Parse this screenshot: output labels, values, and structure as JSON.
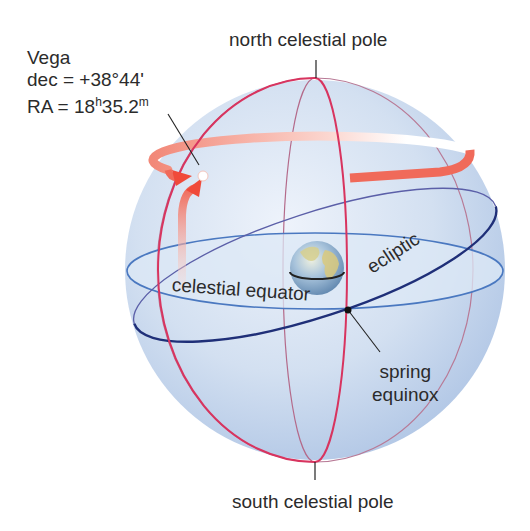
{
  "diagram": {
    "star": {
      "name": "Vega",
      "dec_label": "dec = +38°44'",
      "ra_prefix": "RA = 18",
      "ra_h": "h",
      "ra_mid": "35.2",
      "ra_m": "m"
    },
    "labels": {
      "north_pole": "north celestial pole",
      "south_pole": "south celestial pole",
      "celestial_equator": "celestial equator",
      "ecliptic": "ecliptic",
      "spring_line1": "spring",
      "spring_line2": "equinox"
    },
    "colors": {
      "sphere_fill": "#c9d9ee",
      "sphere_edge": "#a9c1e2",
      "meridian": "#d8345f",
      "meridian_thin": "#b46a8a",
      "equator": "#4a78c0",
      "equator_fill": "#dce8f6",
      "ecliptic": "#1f2f78",
      "ra_arrow": "#f06a5a",
      "dec_arrow": "#f08070",
      "pointer": "#222222"
    }
  }
}
